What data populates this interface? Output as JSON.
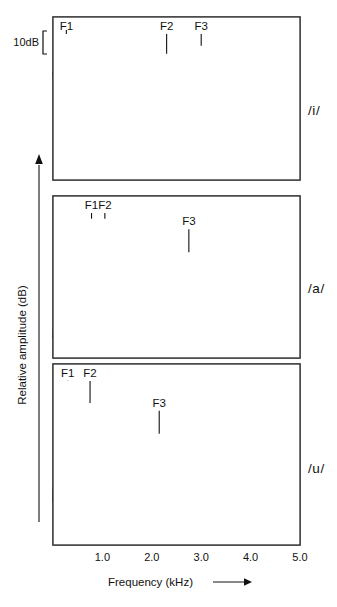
{
  "figure": {
    "name": "vowel-spectra-figure",
    "xlabel": "Frequency (kHz)",
    "ylabel": "Relative amplitude (dB)",
    "scale_marker": "10dB",
    "xtick_labels": [
      "1.0",
      "2.0",
      "3.0",
      "4.0",
      "5.0"
    ],
    "colors": {
      "spectrum": "#000000",
      "envelope": "#7d7d7d",
      "grid": "#d3d3d3",
      "frame": "#3c3c3c",
      "text": "#111111",
      "background": "#ffffff"
    }
  },
  "chart_data": {
    "type": "line",
    "title": "",
    "subtitle": "",
    "xlabel": "Frequency (kHz)",
    "ylabel": "Relative amplitude (dB)",
    "xlim": [
      0,
      5.0
    ],
    "xticks": [
      1.0,
      2.0,
      3.0,
      4.0,
      5.0
    ],
    "ylim_note": "relative dB, arbitrary origin; 10 dB bracket shown at upper left",
    "grid": true,
    "legend_position": "none",
    "scale_bar_db": 10,
    "panels": [
      {
        "vowel": "/i/",
        "panel_index": 0,
        "annotations": [
          {
            "label": "F1",
            "freq_khz": 0.27
          },
          {
            "label": "F2",
            "freq_khz": 2.3
          },
          {
            "label": "F3",
            "freq_khz": 3.0
          }
        ],
        "series": [
          {
            "name": "envelope",
            "x": [
              0.0,
              0.1,
              0.2,
              0.27,
              0.35,
              0.5,
              0.7,
              0.9,
              1.1,
              1.3,
              1.5,
              1.7,
              1.9,
              2.1,
              2.3,
              2.5,
              2.65,
              2.8,
              3.0,
              3.15,
              3.3,
              3.5,
              3.7,
              3.9,
              4.1,
              4.35,
              4.6,
              4.8,
              5.0
            ],
            "values": [
              55,
              58,
              66,
              74,
              68,
              60,
              53,
              48,
              45,
              43,
              42,
              42,
              45,
              52,
              62,
              57,
              57,
              62,
              66,
              61,
              63,
              58,
              54,
              50,
              47,
              45,
              45,
              47,
              50
            ]
          },
          {
            "name": "spectrum",
            "x": [
              0.0,
              0.06,
              0.12,
              0.18,
              0.24,
              0.3,
              0.36,
              0.42,
              0.48,
              0.54,
              0.6,
              0.66,
              0.72,
              0.78,
              0.84,
              0.9,
              0.96,
              1.02,
              1.08,
              1.14,
              1.2,
              1.26,
              1.32,
              1.38,
              1.44,
              1.5,
              1.56,
              1.62,
              1.68,
              1.74,
              1.8,
              1.86,
              1.92,
              1.98,
              2.04,
              2.1,
              2.16,
              2.22,
              2.28,
              2.34,
              2.4,
              2.46,
              2.52,
              2.58,
              2.64,
              2.7,
              2.76,
              2.82,
              2.88,
              2.94,
              3.0,
              3.06,
              3.12,
              3.18,
              3.24,
              3.3,
              3.36,
              3.42,
              3.48,
              3.54,
              3.6,
              3.66,
              3.72,
              3.78,
              3.84,
              3.9,
              3.96,
              4.02,
              4.08,
              4.14,
              4.2,
              4.26,
              4.32,
              4.38,
              4.44,
              4.5,
              4.56,
              4.62,
              4.68,
              4.74,
              4.8,
              4.86,
              4.92,
              4.98
            ],
            "values": [
              54,
              38,
              56,
              74,
              40,
              58,
              30,
              46,
              24,
              40,
              20,
              36,
              17,
              32,
              15,
              30,
              14,
              28,
              12,
              27,
              10,
              26,
              8,
              25,
              14,
              30,
              12,
              28,
              18,
              34,
              22,
              40,
              28,
              48,
              34,
              52,
              40,
              60,
              46,
              62,
              42,
              54,
              38,
              52,
              44,
              58,
              48,
              62,
              52,
              66,
              56,
              62,
              50,
              64,
              54,
              60,
              46,
              58,
              40,
              52,
              30,
              44,
              20,
              34,
              12,
              28,
              18,
              34,
              26,
              42,
              30,
              46,
              24,
              38,
              16,
              30,
              22,
              36,
              28,
              44,
              24,
              40,
              30,
              46
            ]
          }
        ]
      },
      {
        "vowel": "/a/",
        "panel_index": 1,
        "annotations": [
          {
            "label": "F1",
            "freq_khz": 0.78
          },
          {
            "label": "F2",
            "freq_khz": 1.05
          },
          {
            "label": "F3",
            "freq_khz": 2.75
          }
        ],
        "series": [
          {
            "name": "envelope",
            "x": [
              0.0,
              0.1,
              0.25,
              0.4,
              0.55,
              0.7,
              0.8,
              0.95,
              1.05,
              1.15,
              1.3,
              1.45,
              1.6,
              1.8,
              2.0,
              2.2,
              2.4,
              2.6,
              2.75,
              2.9,
              3.05,
              3.25,
              3.45,
              3.65,
              3.85,
              4.05,
              4.25,
              4.45,
              4.65,
              4.85,
              5.0
            ],
            "values": [
              52,
              53,
              55,
              58,
              63,
              68,
              69,
              68,
              69,
              66,
              60,
              54,
              49,
              45,
              43,
              43,
              45,
              49,
              52,
              49,
              45,
              43,
              43,
              45,
              48,
              50,
              51,
              50,
              49,
              49,
              51
            ]
          },
          {
            "name": "spectrum",
            "x": [
              0.0,
              0.04,
              0.08,
              0.12,
              0.16,
              0.2,
              0.24,
              0.28,
              0.32,
              0.36,
              0.4,
              0.44,
              0.48,
              0.52,
              0.56,
              0.6,
              0.64,
              0.68,
              0.72,
              0.76,
              0.8,
              0.84,
              0.88,
              0.92,
              0.96,
              1.0,
              1.04,
              1.08,
              1.12,
              1.16,
              1.2,
              1.26,
              1.32,
              1.38,
              1.44,
              1.5,
              1.56,
              1.62,
              1.68,
              1.74,
              1.8,
              1.86,
              1.92,
              1.98,
              2.04,
              2.1,
              2.16,
              2.22,
              2.28,
              2.34,
              2.4,
              2.46,
              2.52,
              2.58,
              2.64,
              2.7,
              2.76,
              2.82,
              2.88,
              2.94,
              3.0,
              3.06,
              3.12,
              3.18,
              3.24,
              3.3,
              3.36,
              3.42,
              3.48,
              3.54,
              3.6,
              3.66,
              3.72,
              3.78,
              3.84,
              3.9,
              3.96,
              4.02,
              4.08,
              4.14,
              4.2,
              4.26,
              4.32,
              4.38,
              4.44,
              4.5,
              4.56,
              4.62,
              4.68,
              4.74,
              4.8,
              4.86,
              4.92,
              4.98
            ],
            "values": [
              10,
              30,
              16,
              40,
              20,
              48,
              24,
              52,
              28,
              55,
              30,
              58,
              34,
              60,
              38,
              64,
              40,
              66,
              44,
              68,
              40,
              66,
              42,
              68,
              38,
              64,
              34,
              60,
              30,
              52,
              24,
              46,
              20,
              42,
              18,
              38,
              14,
              34,
              16,
              36,
              20,
              38,
              22,
              40,
              26,
              42,
              24,
              40,
              30,
              44,
              34,
              46,
              36,
              50,
              32,
              46,
              38,
              48,
              30,
              44,
              26,
              40,
              22,
              36,
              28,
              42,
              32,
              46,
              36,
              48,
              34,
              46,
              40,
              50,
              44,
              52,
              38,
              48,
              34,
              44,
              30,
              42,
              26,
              38,
              32,
              44,
              36,
              46,
              40,
              48,
              36,
              44,
              42,
              50
            ]
          }
        ]
      },
      {
        "vowel": "/u/",
        "panel_index": 2,
        "annotations": [
          {
            "label": "F1",
            "freq_khz": 0.3
          },
          {
            "label": "F2",
            "freq_khz": 0.75
          },
          {
            "label": "F3",
            "freq_khz": 2.15
          }
        ],
        "series": [
          {
            "name": "envelope",
            "x": [
              0.0,
              0.1,
              0.22,
              0.3,
              0.4,
              0.52,
              0.64,
              0.75,
              0.85,
              0.95,
              1.1,
              1.3,
              1.5,
              1.7,
              1.9,
              2.05,
              2.15,
              2.3,
              2.45,
              2.6,
              2.75,
              2.9,
              3.0,
              3.15,
              3.3,
              3.45,
              3.6,
              3.75,
              3.9,
              4.05,
              4.2,
              4.35,
              4.5,
              4.65,
              4.8,
              5.0
            ],
            "values": [
              60,
              63,
              69,
              73,
              68,
              62,
              62,
              63,
              58,
              52,
              46,
              42,
              41,
              42,
              45,
              48,
              49,
              47,
              44,
              43,
              45,
              49,
              50,
              48,
              45,
              46,
              49,
              50,
              48,
              46,
              45,
              46,
              48,
              50,
              52,
              56
            ]
          },
          {
            "name": "spectrum",
            "x": [
              0.0,
              0.04,
              0.08,
              0.12,
              0.16,
              0.2,
              0.24,
              0.28,
              0.32,
              0.36,
              0.4,
              0.44,
              0.48,
              0.52,
              0.56,
              0.6,
              0.64,
              0.68,
              0.72,
              0.76,
              0.8,
              0.84,
              0.88,
              0.94,
              1.0,
              1.06,
              1.12,
              1.18,
              1.24,
              1.3,
              1.36,
              1.42,
              1.48,
              1.54,
              1.6,
              1.66,
              1.72,
              1.78,
              1.84,
              1.9,
              1.96,
              2.02,
              2.08,
              2.14,
              2.2,
              2.26,
              2.32,
              2.38,
              2.44,
              2.5,
              2.56,
              2.62,
              2.68,
              2.74,
              2.8,
              2.86,
              2.92,
              2.98,
              3.04,
              3.1,
              3.16,
              3.22,
              3.28,
              3.34,
              3.4,
              3.46,
              3.52,
              3.58,
              3.64,
              3.7,
              3.76,
              3.82,
              3.88,
              3.94,
              4.0,
              4.06,
              4.12,
              4.18,
              4.24,
              4.3,
              4.36,
              4.42,
              4.48,
              4.54,
              4.6,
              4.66,
              4.72,
              4.78,
              4.84,
              4.9,
              4.96
            ],
            "values": [
              20,
              48,
              26,
              56,
              30,
              64,
              36,
              70,
              34,
              62,
              26,
              50,
              22,
              44,
              28,
              56,
              34,
              62,
              30,
              54,
              20,
              42,
              14,
              34,
              10,
              28,
              14,
              32,
              18,
              34,
              12,
              28,
              16,
              30,
              20,
              34,
              24,
              38,
              20,
              34,
              26,
              40,
              34,
              46,
              28,
              40,
              18,
              32,
              14,
              28,
              20,
              34,
              26,
              40,
              22,
              36,
              30,
              44,
              34,
              46,
              30,
              42,
              36,
              46,
              32,
              44,
              38,
              48,
              34,
              44,
              28,
              40,
              24,
              36,
              30,
              42,
              26,
              38,
              20,
              32,
              10,
              24,
              6,
              20,
              14,
              28,
              22,
              36,
              28,
              42,
              46
            ]
          }
        ]
      }
    ]
  }
}
